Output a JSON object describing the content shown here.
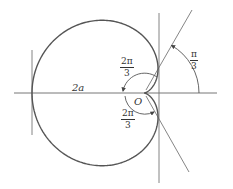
{
  "diagram": {
    "labels": {
      "two_a": "2a",
      "origin": "O",
      "angle_top": {
        "numerator": "2π",
        "denominator": "3"
      },
      "angle_bottom": {
        "numerator": "2π",
        "denominator": "3"
      },
      "angle_right": {
        "numerator": "π",
        "denominator": "3"
      }
    },
    "colors": {
      "curve": "#555555",
      "lines": "#777777",
      "text": "#333333"
    }
  }
}
